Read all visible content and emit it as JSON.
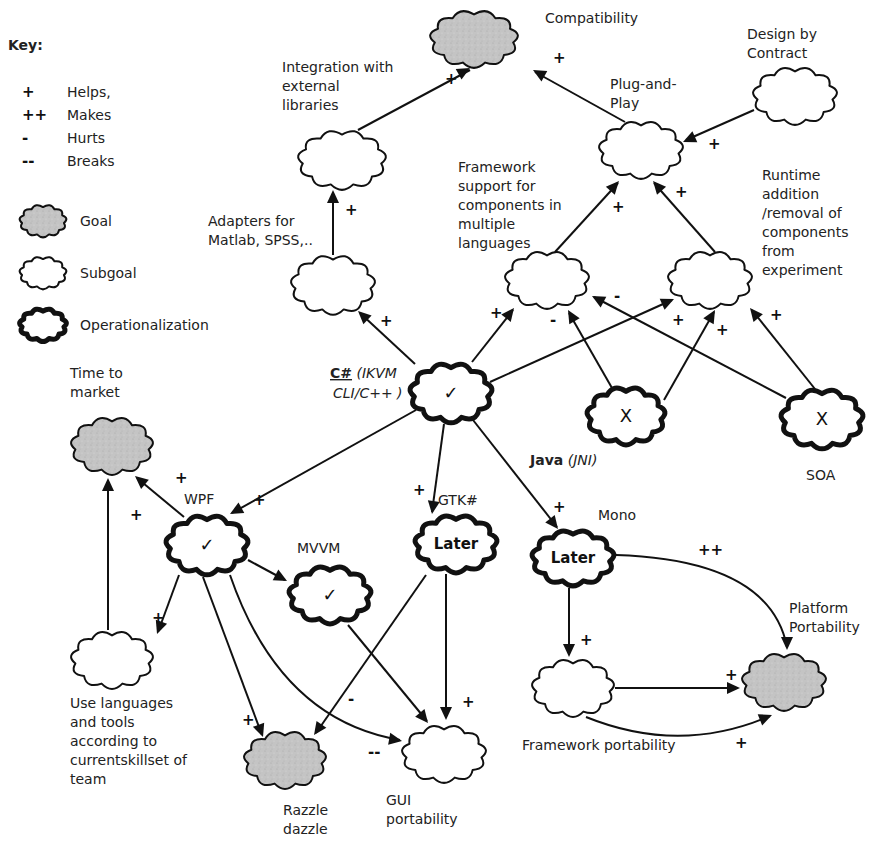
{
  "key": {
    "title": "Key:",
    "contributions": [
      {
        "sym": "+",
        "label": "Helps,"
      },
      {
        "sym": "++",
        "label": "Makes"
      },
      {
        "sym": "-",
        "label": "Hurts"
      },
      {
        "sym": "--",
        "label": "Breaks"
      }
    ],
    "shapes": [
      {
        "type": "goal",
        "label": "Goal"
      },
      {
        "type": "subgoal",
        "label": "Subgoal"
      },
      {
        "type": "oper",
        "label": "Operationalization"
      }
    ]
  },
  "colors": {
    "goal_fill": "#c4c4c4",
    "subgoal_fill": "#ffffff",
    "stroke": "#111111"
  },
  "nodes": [
    {
      "id": "compat",
      "type": "goal",
      "cx": 474,
      "cy": 39,
      "w": 90,
      "h": 60,
      "mark": "",
      "label": [
        "Compatibility"
      ],
      "lx": 545,
      "ly": 23,
      "lstyle": ""
    },
    {
      "id": "integ",
      "type": "subgoal",
      "cx": 342,
      "cy": 160,
      "w": 90,
      "h": 62,
      "mark": "",
      "label": [
        "Integration with",
        "external",
        "libraries"
      ],
      "lx": 282,
      "ly": 72,
      "lstyle": ""
    },
    {
      "id": "plug",
      "type": "subgoal",
      "cx": 641,
      "cy": 150,
      "w": 86,
      "h": 60,
      "mark": "",
      "label": [
        "Plug-and-",
        "Play"
      ],
      "lx": 610,
      "ly": 89,
      "lstyle": ""
    },
    {
      "id": "dbc",
      "type": "subgoal",
      "cx": 795,
      "cy": 96,
      "w": 86,
      "h": 60,
      "mark": "",
      "label": [
        "Design by",
        "Contract"
      ],
      "lx": 747,
      "ly": 39,
      "lstyle": ""
    },
    {
      "id": "adapt",
      "type": "subgoal",
      "cx": 333,
      "cy": 285,
      "w": 86,
      "h": 62,
      "mark": "",
      "label": [
        "Adapters for",
        "Matlab, SPSS,.."
      ],
      "lx": 208,
      "ly": 226,
      "lstyle": ""
    },
    {
      "id": "fsc",
      "type": "subgoal",
      "cx": 547,
      "cy": 280,
      "w": 86,
      "h": 60,
      "mark": "",
      "label": [
        "Framework",
        "support for",
        "components in",
        "multiple",
        "languages"
      ],
      "lx": 458,
      "ly": 172,
      "lstyle": ""
    },
    {
      "id": "rt",
      "type": "subgoal",
      "cx": 710,
      "cy": 280,
      "w": 86,
      "h": 60,
      "mark": "",
      "label": [
        "Runtime",
        "addition",
        "/removal of",
        "components",
        "from",
        "experiment"
      ],
      "lx": 762,
      "ly": 180,
      "lstyle": ""
    },
    {
      "id": "csharp",
      "type": "oper",
      "cx": 451,
      "cy": 393,
      "w": 84,
      "h": 62,
      "mark": "✓",
      "label": [],
      "lx": 0,
      "ly": 0,
      "lstyle": ""
    },
    {
      "id": "java",
      "type": "oper",
      "cx": 626,
      "cy": 416,
      "w": 80,
      "h": 60,
      "mark": "X",
      "label": [],
      "lx": 0,
      "ly": 0,
      "lstyle": ""
    },
    {
      "id": "soa",
      "type": "oper",
      "cx": 822,
      "cy": 419,
      "w": 84,
      "h": 62,
      "mark": "X",
      "label": [
        "SOA"
      ],
      "lx": 806,
      "ly": 480,
      "lstyle": ""
    },
    {
      "id": "ttm",
      "type": "goal",
      "cx": 112,
      "cy": 446,
      "w": 84,
      "h": 60,
      "mark": "",
      "label": [
        "Time to",
        "market"
      ],
      "lx": 70,
      "ly": 378,
      "lstyle": ""
    },
    {
      "id": "wpf",
      "type": "oper",
      "cx": 207,
      "cy": 545,
      "w": 84,
      "h": 62,
      "mark": "✓",
      "label": [
        "WPF"
      ],
      "lx": 184,
      "ly": 504,
      "lstyle": ""
    },
    {
      "id": "gtk",
      "type": "oper",
      "cx": 456,
      "cy": 544,
      "w": 84,
      "h": 60,
      "mark": "Later",
      "label": [
        "GTK#"
      ],
      "lx": 438,
      "ly": 505,
      "lstyle": ""
    },
    {
      "id": "mvvm",
      "type": "oper",
      "cx": 330,
      "cy": 595,
      "w": 84,
      "h": 60,
      "mark": "✓",
      "label": [
        "MVVM"
      ],
      "lx": 297,
      "ly": 553,
      "lstyle": ""
    },
    {
      "id": "mono",
      "type": "oper",
      "cx": 573,
      "cy": 558,
      "w": 84,
      "h": 58,
      "mark": "Later",
      "label": [
        "Mono"
      ],
      "lx": 598,
      "ly": 520,
      "lstyle": ""
    },
    {
      "id": "plat",
      "type": "goal",
      "cx": 784,
      "cy": 682,
      "w": 86,
      "h": 60,
      "mark": "",
      "label": [
        "Platform",
        "Portability"
      ],
      "lx": 789,
      "ly": 613,
      "lstyle": ""
    },
    {
      "id": "team",
      "type": "subgoal",
      "cx": 112,
      "cy": 660,
      "w": 84,
      "h": 60,
      "mark": "",
      "label": [
        "Use languages",
        "and tools",
        "according to",
        "currentskillset of",
        "team"
      ],
      "lx": 70,
      "ly": 708,
      "lstyle": ""
    },
    {
      "id": "fwport",
      "type": "subgoal",
      "cx": 573,
      "cy": 688,
      "w": 84,
      "h": 60,
      "mark": "",
      "label": [
        "Framework portability"
      ],
      "lx": 522,
      "ly": 750,
      "lstyle": ""
    },
    {
      "id": "razzle",
      "type": "goal",
      "cx": 285,
      "cy": 760,
      "w": 84,
      "h": 60,
      "mark": "",
      "label": [
        "Razzle",
        "dazzle"
      ],
      "lx": 283,
      "ly": 815,
      "lstyle": ""
    },
    {
      "id": "gui",
      "type": "subgoal",
      "cx": 444,
      "cy": 754,
      "w": 86,
      "h": 60,
      "mark": "",
      "label": [
        "GUI",
        "portability"
      ],
      "lx": 386,
      "ly": 805,
      "lstyle": ""
    }
  ],
  "op_labels": [
    {
      "id": "csharp_lbl",
      "x": 330,
      "y": 378,
      "parts": [
        {
          "t": "C#",
          "style": "bu"
        },
        {
          "t": " (IKVM",
          "style": "i"
        }
      ]
    },
    {
      "id": "csharp_lbl2",
      "x": 333,
      "y": 398,
      "parts": [
        {
          "t": "CLI/C++ )",
          "style": "i"
        }
      ]
    },
    {
      "id": "java_lbl",
      "x": 530,
      "y": 465,
      "parts": [
        {
          "t": "Java",
          "style": "b"
        },
        {
          "t": "  (JNI)",
          "style": "i"
        }
      ]
    }
  ],
  "edges": [
    {
      "from": "integ",
      "d": "M 358 130 L 470 70",
      "head": [
        470,
        68
      ],
      "angle": -29,
      "sign": "+",
      "sx": 445,
      "sy": 84
    },
    {
      "from": "plug",
      "d": "M 625 122 L 535 72",
      "head": [
        533,
        70
      ],
      "angle": 209,
      "sign": "+",
      "sx": 553,
      "sy": 63
    },
    {
      "from": "dbc",
      "d": "M 754 110 L 686 140",
      "head": [
        683,
        142
      ],
      "angle": 156,
      "sign": "+",
      "sx": 708,
      "sy": 149
    },
    {
      "from": "adapt",
      "d": "M 333 255 L 333 192",
      "head": [
        333,
        190
      ],
      "angle": -90,
      "sign": "+",
      "sx": 345,
      "sy": 215
    },
    {
      "from": "fsc",
      "d": "M 555 252 L 618 183",
      "head": [
        619,
        181
      ],
      "angle": -48,
      "sign": "+",
      "sx": 612,
      "sy": 212
    },
    {
      "from": "rt",
      "d": "M 715 252 L 654 183",
      "head": [
        653,
        181
      ],
      "angle": 229,
      "sign": "+",
      "sx": 675,
      "sy": 197
    },
    {
      "from": "csharp",
      "d": "M 415 364 L 360 313",
      "head": [
        358,
        311
      ],
      "angle": 223,
      "sign": "+",
      "sx": 380,
      "sy": 326
    },
    {
      "from": "csharp",
      "d": "M 472 362 L 513 310",
      "head": [
        514,
        308
      ],
      "angle": -52,
      "sign": "+",
      "sx": 490,
      "sy": 318
    },
    {
      "from": "csharp",
      "d": "M 490 382 L 672 300",
      "head": [
        674,
        299
      ],
      "angle": -24,
      "sign": "+",
      "sx": 672,
      "sy": 325
    },
    {
      "from": "java",
      "d": "M 612 388 L 569 313",
      "head": [
        568,
        310
      ],
      "angle": 240,
      "sign": "-",
      "sx": 550,
      "sy": 325
    },
    {
      "from": "java",
      "d": "M 664 400 L 714 312",
      "head": [
        715,
        310
      ],
      "angle": -60,
      "sign": "+",
      "sx": 716,
      "sy": 335
    },
    {
      "from": "soa",
      "d": "M 786 398 L 594 297",
      "head": [
        592,
        296
      ],
      "angle": 208,
      "sign": "-",
      "sx": 614,
      "sy": 301
    },
    {
      "from": "soa",
      "d": "M 815 389 L 752 310",
      "head": [
        750,
        308
      ],
      "angle": 231,
      "sign": "+",
      "sx": 770,
      "sy": 320
    },
    {
      "from": "csharp",
      "d": "M 416 410 L 232 513",
      "head": [
        230,
        514
      ],
      "angle": 151,
      "sign": "+",
      "sx": 253,
      "sy": 505
    },
    {
      "from": "csharp",
      "d": "M 444 424 L 432 512",
      "head": [
        432,
        514
      ],
      "angle": 98,
      "sign": "+",
      "sx": 413,
      "sy": 495
    },
    {
      "from": "csharp",
      "d": "M 473 420 L 557 527",
      "head": [
        558,
        529
      ],
      "angle": 52,
      "sign": "+",
      "sx": 553,
      "sy": 512
    },
    {
      "from": "wpf",
      "d": "M 184 517 L 137 478",
      "head": [
        135,
        476
      ],
      "angle": 220,
      "sign": "+",
      "sx": 175,
      "sy": 483
    },
    {
      "from": "team",
      "d": "M 108 630 L 108 480",
      "head": [
        108,
        478
      ],
      "angle": -90,
      "sign": "+",
      "sx": 130,
      "sy": 520
    },
    {
      "from": "wpf",
      "d": "M 179 575 L 158 632",
      "head": [
        157,
        634
      ],
      "angle": 110,
      "sign": "+",
      "sx": 152,
      "sy": 623
    },
    {
      "from": "wpf",
      "d": "M 248 560 L 285 580",
      "head": [
        287,
        581
      ],
      "angle": 28,
      "sign": "",
      "sx": 0,
      "sy": 0
    },
    {
      "from": "wpf",
      "d": "M 203 577 L 262 735",
      "head": [
        263,
        737
      ],
      "angle": 70,
      "sign": "+",
      "sx": 242,
      "sy": 725
    },
    {
      "from": "wpf",
      "d": "M 230 575 Q 280 720 400 740",
      "head": [
        402,
        741
      ],
      "angle": 10,
      "sign": "--",
      "sx": 368,
      "sy": 757
    },
    {
      "from": "gtk",
      "d": "M 426 575 L 316 733",
      "head": [
        314,
        735
      ],
      "angle": 125,
      "sign": "-",
      "sx": 348,
      "sy": 704
    },
    {
      "from": "mvvm",
      "d": "M 348 625 L 427 721",
      "head": [
        428,
        723
      ],
      "angle": 51,
      "sign": "",
      "sx": 0,
      "sy": 0
    },
    {
      "from": "gtk",
      "d": "M 446 574 L 446 718",
      "head": [
        446,
        720
      ],
      "angle": 90,
      "sign": "+",
      "sx": 462,
      "sy": 707
    },
    {
      "from": "mono",
      "d": "M 569 588 L 569 655",
      "head": [
        569,
        657
      ],
      "angle": 90,
      "sign": "+",
      "sx": 580,
      "sy": 645
    },
    {
      "from": "mono",
      "d": "M 616 555 Q 770 560 787 647",
      "head": [
        787,
        650
      ],
      "angle": 90,
      "sign": "++",
      "sx": 698,
      "sy": 555
    },
    {
      "from": "fwport",
      "d": "M 615 688 L 738 688",
      "head": [
        740,
        688
      ],
      "angle": 0,
      "sign": "+",
      "sx": 725,
      "sy": 680
    },
    {
      "from": "fwport",
      "d": "M 586 717 Q 680 755 770 716",
      "head": [
        772,
        715
      ],
      "angle": -22,
      "sign": "+",
      "sx": 735,
      "sy": 748
    }
  ]
}
